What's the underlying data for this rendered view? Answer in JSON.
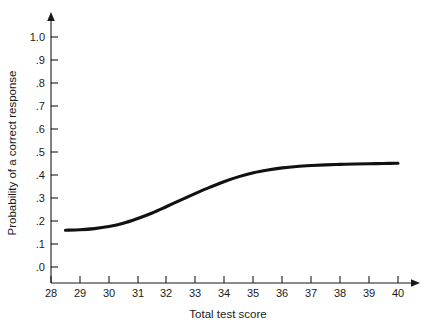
{
  "chart_data": {
    "type": "line",
    "title": "",
    "subtitle": "",
    "xlabel": "Total test score",
    "ylabel": "Probability of a correct response",
    "xlim": [
      28,
      40
    ],
    "ylim": [
      0.0,
      1.0
    ],
    "grid": false,
    "legend": null,
    "legend_position": "none",
    "xticks": [
      28,
      29,
      30,
      31,
      32,
      33,
      34,
      35,
      36,
      37,
      38,
      39,
      40
    ],
    "xticklabels": [
      "28",
      "29",
      "30",
      "31",
      "32",
      "33",
      "34",
      "35",
      "36",
      "37",
      "38",
      "39",
      "40"
    ],
    "yticks": [
      0.0,
      0.1,
      0.2,
      0.3,
      0.4,
      0.5,
      0.6,
      0.7,
      0.8,
      0.9,
      1.0
    ],
    "yticklabels": [
      ".0",
      ".1",
      ".2",
      ".3",
      ".4",
      ".5",
      ".6",
      ".7",
      ".8",
      ".9",
      "1.0"
    ],
    "series": [
      {
        "name": "Item characteristic curve",
        "color": "#111111",
        "x": [
          28.5,
          29.0,
          29.5,
          30.0,
          30.5,
          31.0,
          31.5,
          32.0,
          32.5,
          33.0,
          33.5,
          34.0,
          34.5,
          35.0,
          35.5,
          36.0,
          36.5,
          37.0,
          37.5,
          38.0,
          38.5,
          39.0,
          39.5,
          40.0
        ],
        "values": [
          0.16,
          0.162,
          0.167,
          0.176,
          0.19,
          0.211,
          0.235,
          0.263,
          0.292,
          0.32,
          0.347,
          0.372,
          0.393,
          0.41,
          0.422,
          0.431,
          0.437,
          0.441,
          0.444,
          0.446,
          0.448,
          0.449,
          0.45,
          0.451
        ]
      }
    ]
  },
  "axes": {
    "x_arrow": true,
    "y_arrow": true,
    "background_color": "#ffffff",
    "axis_color": "#1a1a1a",
    "curve_color": "#111111"
  }
}
